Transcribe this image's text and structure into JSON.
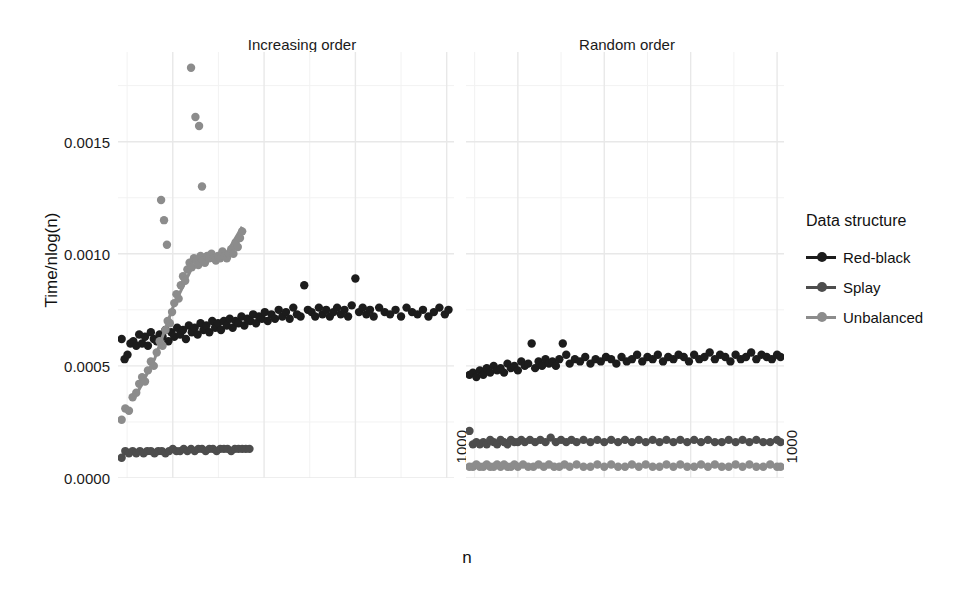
{
  "chart_data": {
    "type": "scatter",
    "title": "",
    "xlabel": "n",
    "ylabel": "Time/nlog(n)",
    "xlim": [
      100,
      1020
    ],
    "ylim": [
      0.0,
      0.0019
    ],
    "grid": true,
    "legend_position": "right",
    "legend_title": "Data structure",
    "facet_titles": [
      "Increasing order",
      "Random order"
    ],
    "y_ticks": [
      "0.0000",
      "0.0005",
      "0.0010",
      "0.0015"
    ],
    "y_tick_values": [
      0.0,
      0.0005,
      0.001,
      0.0015
    ],
    "x_ticks": [
      "250",
      "500",
      "750",
      "1000"
    ],
    "x_tick_values": [
      250,
      500,
      750,
      1000
    ],
    "series_colors": {
      "Red-black": "#1c1c1c",
      "Splay": "#4d4d4d",
      "Unbalanced": "#8c8c8c"
    },
    "panels": [
      {
        "name": "Increasing order",
        "series": [
          {
            "name": "Red-black",
            "color": "#1c1c1c",
            "x": [
              110,
              118,
              126,
              134,
              142,
              150,
              158,
              166,
              174,
              182,
              190,
              198,
              206,
              214,
              222,
              230,
              238,
              246,
              254,
              262,
              270,
              278,
              286,
              294,
              302,
              310,
              318,
              326,
              334,
              342,
              350,
              358,
              366,
              374,
              382,
              390,
              398,
              406,
              414,
              422,
              430,
              438,
              446,
              454,
              462,
              470,
              478,
              486,
              494,
              502,
              510,
              520,
              530,
              540,
              550,
              560,
              570,
              580,
              590,
              600,
              610,
              620,
              630,
              640,
              650,
              660,
              670,
              680,
              690,
              700,
              710,
              720,
              730,
              740,
              750,
              760,
              770,
              780,
              790,
              800,
              815,
              830,
              845,
              860,
              875,
              890,
              905,
              920,
              935,
              950,
              965,
              980,
              995,
              1005
            ],
            "y": [
              0.00062,
              0.00053,
              0.00055,
              0.0006,
              0.00061,
              0.00059,
              0.00064,
              0.0006,
              0.00063,
              0.00059,
              0.00065,
              0.00062,
              0.00061,
              0.00064,
              0.00063,
              0.00066,
              0.00061,
              0.00065,
              0.00063,
              0.00067,
              0.00064,
              0.00066,
              0.00062,
              0.00068,
              0.00065,
              0.00067,
              0.00064,
              0.00069,
              0.00066,
              0.00068,
              0.00065,
              0.0007,
              0.00067,
              0.00069,
              0.00066,
              0.0007,
              0.00068,
              0.00071,
              0.00067,
              0.0007,
              0.00069,
              0.00072,
              0.00068,
              0.00071,
              0.0007,
              0.00073,
              0.00069,
              0.00072,
              0.00071,
              0.00074,
              0.0007,
              0.00073,
              0.00071,
              0.00075,
              0.00072,
              0.00074,
              0.00071,
              0.00076,
              0.00073,
              0.00072,
              0.00086,
              0.00075,
              0.00074,
              0.00072,
              0.00076,
              0.00073,
              0.00075,
              0.00072,
              0.00074,
              0.00076,
              0.00073,
              0.00075,
              0.00072,
              0.00077,
              0.00089,
              0.00074,
              0.00076,
              0.00073,
              0.00075,
              0.00072,
              0.00076,
              0.00074,
              0.00073,
              0.00075,
              0.00072,
              0.00076,
              0.00074,
              0.00073,
              0.00075,
              0.00072,
              0.00074,
              0.00076,
              0.00073,
              0.00075
            ]
          },
          {
            "name": "Splay",
            "color": "#4d4d4d",
            "x": [
              110,
              120,
              130,
              140,
              150,
              160,
              170,
              180,
              190,
              200,
              210,
              220,
              230,
              240,
              250,
              260,
              270,
              280,
              290,
              300,
              310,
              320,
              330,
              340,
              350,
              360,
              370,
              380,
              390,
              400,
              410,
              420,
              430,
              440,
              450,
              460
            ],
            "y": [
              9e-05,
              0.00012,
              0.00011,
              0.00012,
              0.00011,
              0.00012,
              0.00011,
              0.00012,
              0.00012,
              0.00011,
              0.00012,
              0.00012,
              0.00011,
              0.00012,
              0.00013,
              0.00012,
              0.00012,
              0.00013,
              0.00012,
              0.00013,
              0.00012,
              0.00013,
              0.00013,
              0.00012,
              0.00013,
              0.00013,
              0.00012,
              0.00013,
              0.00013,
              0.00013,
              0.00012,
              0.00013,
              0.00013,
              0.00013,
              0.00013,
              0.00013
            ]
          },
          {
            "name": "Unbalanced",
            "color": "#8c8c8c",
            "x": [
              110,
              120,
              130,
              140,
              150,
              158,
              166,
              174,
              182,
              190,
              198,
              206,
              214,
              222,
              230,
              236,
              242,
              248,
              254,
              260,
              266,
              272,
              278,
              284,
              290,
              296,
              302,
              308,
              314,
              320,
              326,
              332,
              338,
              344,
              350,
              356,
              362,
              368,
              374,
              380,
              386,
              392,
              398,
              404,
              410,
              416,
              422,
              428,
              434,
              440,
              218,
              226,
              234,
              300,
              312,
              322,
              330
            ],
            "y": [
              0.00026,
              0.00031,
              0.0003,
              0.00036,
              0.00038,
              0.00042,
              0.00045,
              0.00043,
              0.00048,
              0.00052,
              0.0005,
              0.00056,
              0.00061,
              0.00059,
              0.00066,
              0.0007,
              0.00069,
              0.00074,
              0.00078,
              0.00082,
              0.0008,
              0.00086,
              0.0009,
              0.00088,
              0.00093,
              0.00096,
              0.00094,
              0.00098,
              0.00097,
              0.00095,
              0.00099,
              0.00097,
              0.00096,
              0.00099,
              0.00098,
              0.001,
              0.00098,
              0.00097,
              0.00099,
              0.00098,
              0.00101,
              0.00099,
              0.00098,
              0.001,
              0.00102,
              0.001,
              0.00105,
              0.00103,
              0.00107,
              0.0011,
              0.00124,
              0.00115,
              0.00104,
              0.00183,
              0.00161,
              0.00157,
              0.0013
            ],
            "trend_line": {
              "x": [
                150,
                200,
                250,
                300,
                350,
                400,
                440
              ],
              "y": [
                0.00037,
                0.00053,
                0.00076,
                0.00093,
                0.00098,
                0.00101,
                0.00112
              ]
            }
          }
        ]
      },
      {
        "name": "Random order",
        "series": [
          {
            "name": "Red-black",
            "color": "#1c1c1c",
            "x": [
              110,
              120,
              130,
              140,
              150,
              160,
              170,
              180,
              190,
              200,
              210,
              220,
              230,
              240,
              250,
              260,
              270,
              280,
              290,
              300,
              310,
              320,
              330,
              340,
              350,
              360,
              370,
              380,
              390,
              400,
              415,
              430,
              445,
              460,
              475,
              490,
              505,
              520,
              535,
              550,
              565,
              580,
              595,
              610,
              625,
              640,
              655,
              670,
              685,
              700,
              715,
              730,
              745,
              760,
              775,
              790,
              805,
              820,
              835,
              850,
              865,
              880,
              895,
              910,
              925,
              940,
              955,
              970,
              985,
              1000,
              1010
            ],
            "y": [
              0.00046,
              0.00047,
              0.00045,
              0.00048,
              0.00046,
              0.00049,
              0.00047,
              0.0005,
              0.00048,
              0.00049,
              0.00047,
              0.00051,
              0.00049,
              0.0005,
              0.00048,
              0.00052,
              0.0005,
              0.00051,
              0.0006,
              0.00049,
              0.00052,
              0.0005,
              0.00053,
              0.00051,
              0.00052,
              0.0005,
              0.00053,
              0.0006,
              0.00055,
              0.00051,
              0.00053,
              0.00052,
              0.00054,
              0.00051,
              0.00053,
              0.00052,
              0.00054,
              0.00053,
              0.00051,
              0.00054,
              0.00052,
              0.00053,
              0.00055,
              0.00052,
              0.00054,
              0.00053,
              0.00055,
              0.00052,
              0.00054,
              0.00053,
              0.00055,
              0.00054,
              0.00052,
              0.00055,
              0.00053,
              0.00054,
              0.00056,
              0.00053,
              0.00055,
              0.00054,
              0.00052,
              0.00055,
              0.00053,
              0.00054,
              0.00056,
              0.00053,
              0.00055,
              0.00054,
              0.00053,
              0.00055,
              0.00054
            ]
          },
          {
            "name": "Splay",
            "color": "#4d4d4d",
            "x": [
              110,
              120,
              130,
              140,
              150,
              160,
              170,
              180,
              190,
              200,
              210,
              220,
              230,
              240,
              250,
              260,
              270,
              285,
              300,
              315,
              330,
              345,
              360,
              375,
              390,
              405,
              420,
              440,
              460,
              480,
              500,
              520,
              540,
              560,
              580,
              600,
              620,
              640,
              660,
              680,
              700,
              720,
              740,
              760,
              780,
              800,
              820,
              840,
              860,
              880,
              900,
              920,
              940,
              960,
              980,
              1000,
              1010
            ],
            "y": [
              0.00021,
              0.00015,
              0.00016,
              0.00015,
              0.00016,
              0.00015,
              0.00017,
              0.00016,
              0.00015,
              0.00017,
              0.00016,
              0.00015,
              0.00017,
              0.00016,
              0.00016,
              0.00017,
              0.00016,
              0.00017,
              0.00016,
              0.00017,
              0.00016,
              0.00018,
              0.00016,
              0.00017,
              0.00016,
              0.00017,
              0.00016,
              0.00017,
              0.00016,
              0.00017,
              0.00016,
              0.00017,
              0.00016,
              0.00017,
              0.00016,
              0.00017,
              0.00016,
              0.00017,
              0.00016,
              0.00017,
              0.00016,
              0.00017,
              0.00016,
              0.00017,
              0.00016,
              0.00017,
              0.00016,
              0.00016,
              0.00017,
              0.00016,
              0.00017,
              0.00016,
              0.00017,
              0.00016,
              0.00016,
              0.00017,
              0.00016
            ]
          },
          {
            "name": "Unbalanced",
            "color": "#8c8c8c",
            "x": [
              110,
              120,
              130,
              140,
              150,
              160,
              170,
              180,
              190,
              200,
              210,
              220,
              230,
              240,
              250,
              265,
              280,
              295,
              310,
              325,
              340,
              355,
              370,
              385,
              400,
              420,
              440,
              460,
              480,
              500,
              520,
              540,
              560,
              580,
              600,
              620,
              640,
              660,
              680,
              700,
              720,
              740,
              760,
              780,
              800,
              820,
              840,
              860,
              880,
              900,
              920,
              940,
              960,
              980,
              1000,
              1010
            ],
            "y": [
              5e-05,
              5e-05,
              6e-05,
              5e-05,
              5e-05,
              6e-05,
              5e-05,
              5e-05,
              6e-05,
              5e-05,
              6e-05,
              5e-05,
              5e-05,
              6e-05,
              5e-05,
              6e-05,
              5e-05,
              5e-05,
              6e-05,
              5e-05,
              6e-05,
              5e-05,
              5e-05,
              6e-05,
              5e-05,
              6e-05,
              5e-05,
              5e-05,
              6e-05,
              5e-05,
              6e-05,
              5e-05,
              5e-05,
              6e-05,
              5e-05,
              6e-05,
              5e-05,
              5e-05,
              6e-05,
              5e-05,
              6e-05,
              5e-05,
              5e-05,
              6e-05,
              5e-05,
              6e-05,
              5e-05,
              5e-05,
              6e-05,
              5e-05,
              6e-05,
              5e-05,
              5e-05,
              6e-05,
              5e-05,
              5e-05
            ]
          }
        ]
      }
    ]
  },
  "legend": {
    "title": "Data structure",
    "items": [
      {
        "label": "Red-black",
        "color": "#1c1c1c"
      },
      {
        "label": "Splay",
        "color": "#4d4d4d"
      },
      {
        "label": "Unbalanced",
        "color": "#8c8c8c"
      }
    ]
  },
  "axes": {
    "y_title": "Time/nlog(n)",
    "x_title": "n",
    "y_tick_labels": [
      "0.0015",
      "0.0010",
      "0.0005",
      "0.0000"
    ],
    "x_tick_labels": [
      "250",
      "500",
      "750",
      "1000"
    ]
  },
  "facets": {
    "left_title": "Increasing order",
    "right_title": "Random order"
  }
}
